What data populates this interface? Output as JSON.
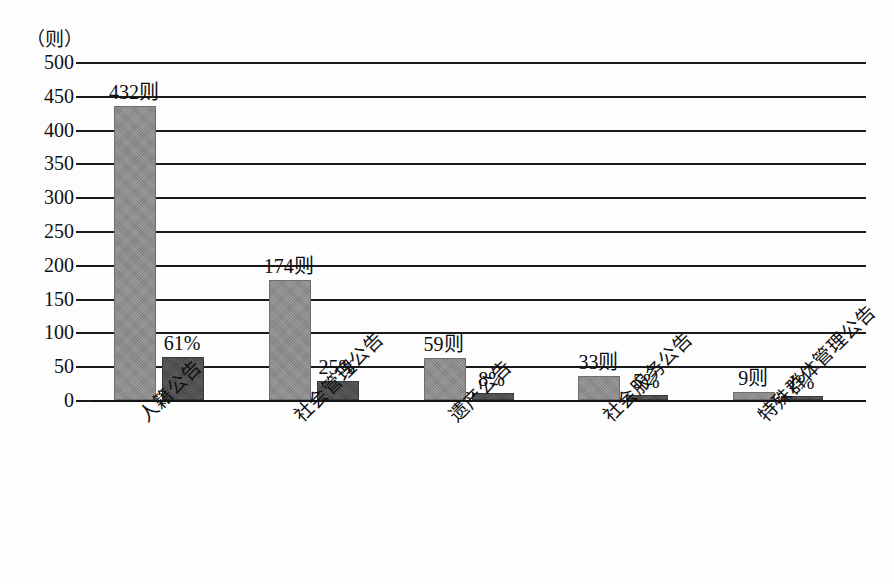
{
  "chart_data": {
    "type": "bar",
    "title": "",
    "subtitle": "",
    "xlabel": "",
    "ylabel": "（则）",
    "ylim": [
      0,
      500
    ],
    "ytick_values": [
      500,
      450,
      400,
      350,
      300,
      250,
      200,
      150,
      100,
      50,
      0
    ],
    "ytick_labels": [
      "500",
      "450",
      "400",
      "350",
      "300",
      "250",
      "200",
      "150",
      "100",
      "50",
      "0"
    ],
    "grid": true,
    "legend": "none",
    "categories": [
      "人籍公告",
      "社会管理公告",
      "遗产公告",
      "社会服务公告",
      "特殊群体管理公告"
    ],
    "series": [
      {
        "name": "数量（则）",
        "color": "#8a8a8a",
        "values": [
          432,
          174,
          59,
          33,
          9
        ],
        "data_labels": [
          "432则",
          "174则",
          "59则",
          "33则",
          "9则"
        ]
      },
      {
        "name": "占比（%）",
        "color": "#4b4b4b",
        "values": [
          61,
          25,
          8,
          5,
          1
        ],
        "data_labels": [
          "61%",
          "25%",
          "8%",
          "5%",
          "1%"
        ]
      }
    ]
  },
  "axis": {
    "unit_caption": "（则）"
  },
  "colors": {
    "count_bar": "#8a8a8a",
    "pct_bar": "#4b4b4b",
    "gridline": "#1b1b1b",
    "text": "#101010",
    "background": "#fdfdfd"
  }
}
